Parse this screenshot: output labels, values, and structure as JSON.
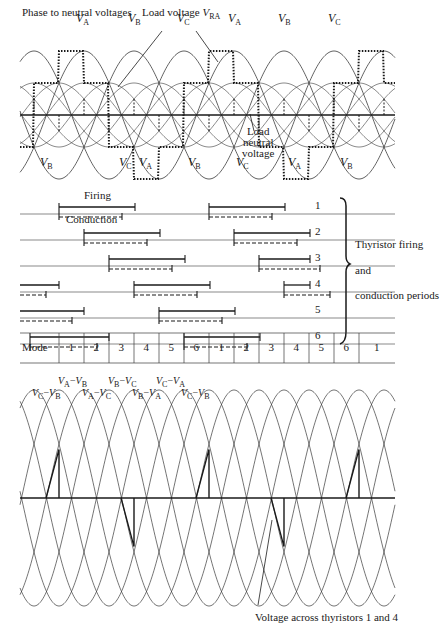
{
  "figure": {
    "top_panel": {
      "title_left": "Phase to neutral voltages",
      "title_load": "Load voltage",
      "load_symbol": "V",
      "load_sub": "RA",
      "annotation_neutral": [
        "Load",
        "neutral",
        "voltage"
      ],
      "phase_labels_top": [
        {
          "v": "V",
          "sub": "A",
          "x": 76,
          "y": 12
        },
        {
          "v": "V",
          "sub": "B",
          "x": 128,
          "y": 12
        },
        {
          "v": "V",
          "sub": "C",
          "x": 177,
          "y": 12
        },
        {
          "v": "V",
          "sub": "A",
          "x": 228,
          "y": 12
        },
        {
          "v": "V",
          "sub": "B",
          "x": 278,
          "y": 12
        },
        {
          "v": "V",
          "sub": "C",
          "x": 328,
          "y": 12
        }
      ],
      "phase_labels_bottom": [
        {
          "v": "V",
          "sub": "B",
          "x": 40,
          "y": 156
        },
        {
          "v": "V",
          "sub": "C",
          "x": 119,
          "y": 156
        },
        {
          "v": "V",
          "sub": "A",
          "x": 139,
          "y": 156
        },
        {
          "v": "V",
          "sub": "B",
          "x": 188,
          "y": 156
        },
        {
          "v": "V",
          "sub": "C",
          "x": 236,
          "y": 156
        },
        {
          "v": "V",
          "sub": "A",
          "x": 288,
          "y": 156
        },
        {
          "v": "V",
          "sub": "B",
          "x": 340,
          "y": 156
        }
      ]
    },
    "middle_panel": {
      "label_firing": "Firing",
      "label_conduction": "Conduction",
      "thyristor_numbers": [
        "1",
        "2",
        "3",
        "4",
        "5",
        "6"
      ],
      "brace_text": [
        "Thyristor firing",
        "and",
        "conduction periods"
      ],
      "mode_header": "Mode",
      "modes": [
        "1",
        "2",
        "3",
        "4",
        "5",
        "6",
        "1",
        "2",
        "3",
        "4",
        "5",
        "6",
        "1"
      ]
    },
    "bottom_panel": {
      "line_labels_row1": [
        {
          "a": "A",
          "b": "B",
          "x": 58,
          "y": 376
        },
        {
          "a": "B",
          "b": "C",
          "x": 108,
          "y": 376
        },
        {
          "a": "C",
          "b": "A",
          "x": 156,
          "y": 376
        }
      ],
      "line_labels_row2": [
        {
          "a": "C",
          "b": "B",
          "x": 32,
          "y": 388
        },
        {
          "a": "A",
          "b": "C",
          "x": 82,
          "y": 388
        },
        {
          "a": "B",
          "b": "A",
          "x": 132,
          "y": 388
        },
        {
          "a": "C",
          "b": "B",
          "x": 181,
          "y": 388
        }
      ],
      "caption": "Voltage across thyristors 1 and 4"
    },
    "colors": {
      "ink": "#1a1a1a",
      "thin": "#3a3a3a",
      "background": "#ffffff"
    }
  },
  "chart_data": {
    "type": "diagram",
    "geometry": {
      "period_px": 150,
      "mode_width_px": 25,
      "top_axis_y": 115,
      "phase_amplitude_px": 64,
      "neutral_amplitude_px": 32,
      "bottom_axis_y": 498,
      "line_amplitude_px": 108,
      "x_start": 20,
      "x_end": 395
    },
    "thyristor_rows": [
      {
        "id": 1,
        "y": 203,
        "firing": [
          [
            59,
            135
          ],
          [
            209,
            285
          ]
        ],
        "conduction": [
          [
            59,
            122
          ],
          [
            209,
            272
          ]
        ]
      },
      {
        "id": 2,
        "y": 229,
        "firing": [
          [
            84,
            160
          ],
          [
            234,
            310
          ]
        ],
        "conduction": [
          [
            84,
            147
          ],
          [
            234,
            297
          ]
        ]
      },
      {
        "id": 3,
        "y": 255,
        "firing": [
          [
            109,
            185
          ],
          [
            259,
            310
          ]
        ],
        "conduction": [
          [
            109,
            172
          ],
          [
            259,
            320
          ]
        ]
      },
      {
        "id": 4,
        "y": 281,
        "firing": [
          [
            20,
            59
          ],
          [
            134,
            210
          ],
          [
            284,
            310
          ]
        ],
        "conduction": [
          [
            20,
            46
          ],
          [
            134,
            197
          ],
          [
            284,
            330
          ]
        ]
      },
      {
        "id": 5,
        "y": 307,
        "firing": [
          [
            20,
            84
          ],
          [
            159,
            235
          ],
          [
            310,
            310
          ]
        ],
        "conduction": [
          [
            20,
            72
          ],
          [
            159,
            222
          ]
        ]
      },
      {
        "id": 6,
        "y": 333,
        "firing": [
          [
            30,
            109
          ],
          [
            184,
            260
          ]
        ],
        "conduction": [
          [
            30,
            97
          ],
          [
            184,
            247
          ]
        ]
      }
    ],
    "mode_table": {
      "y_top": 333,
      "y_bottom": 363,
      "cell_edges_x": [
        59,
        84,
        109,
        134,
        159,
        184,
        209,
        234,
        259,
        284,
        309,
        334,
        359,
        395
      ]
    },
    "thyristor_voltage_spikes": [
      {
        "x0": 46,
        "x1": 59,
        "peak": 1.0
      },
      {
        "x0": 121,
        "x1": 134,
        "peak": -1.0
      },
      {
        "x0": 196,
        "x1": 209,
        "peak": 1.0
      },
      {
        "x0": 271,
        "x1": 284,
        "peak": -1.0
      },
      {
        "x0": 346,
        "x1": 359,
        "peak": 1.0
      }
    ]
  }
}
